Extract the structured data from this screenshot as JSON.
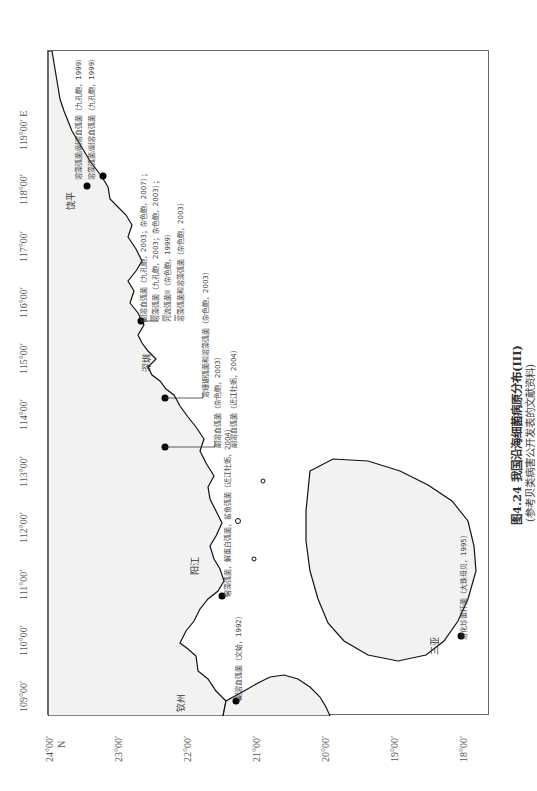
{
  "figure": {
    "caption_title": "图4.24  我国沿海细菌病原分布(III)",
    "caption_subtitle": "(参考贝类病害公开发表的文献资料)"
  },
  "axes": {
    "longitude_ticks": [
      "119°00′ E",
      "118°00′",
      "117°00′",
      "116°00′",
      "115°00′",
      "114°00′",
      "113°00′",
      "112°00′",
      "111°00′",
      "110°00′",
      "109°00′"
    ],
    "latitude_ticks": [
      "24°00′",
      "23°00′",
      "22°00′",
      "21°00′",
      "20°00′",
      "19°00′",
      "18°00′"
    ],
    "latitude_unit": "N"
  },
  "cities": [
    {
      "name": "饶平"
    },
    {
      "name": "深圳"
    },
    {
      "name": "阳江"
    },
    {
      "name": "钦州"
    },
    {
      "name": "三亚"
    }
  ],
  "annotations": [
    {
      "text": "溶藻弧菌/副溶血弧菌（九孔鲍，1999）"
    },
    {
      "text": "溶藻弧菌/副溶血弧菌（九孔鲍，1999）"
    },
    {
      "text": "副溶血弧菌（九孔鲍，2003；杂色鲍，2007）；"
    },
    {
      "text": "溶藻弧菌（九孔鲍，2003；杂色鲍，2003）；"
    },
    {
      "text": "河流弧菌II（杂色鲍，1999）"
    },
    {
      "text": "溶藻弧菌和溶藻弧菌（杂色鲍，2003）"
    },
    {
      "text": "溶珊瑚弧菌和溶藻弧菌（杂色鲍，2003）"
    },
    {
      "text": "副溶血弧菌（杂色鲍，2003）"
    },
    {
      "text": "副溶血弧菌（近江牡蛎，2004）"
    },
    {
      "text": "溶藻弧菌，解蛋白弧菌，鲨鱼弧菌（近江牡蛎，2004）"
    },
    {
      "text": "副溶血弧菌（文蛤，1992）"
    },
    {
      "text": "溶化珍蛋杆菌（大珠母贝，1995）"
    }
  ]
}
